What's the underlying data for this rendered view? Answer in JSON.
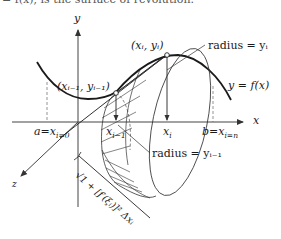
{
  "caption_fragment": "= f(x), is the surface of revolution.",
  "axes": {
    "x_label": "x",
    "y_label": "y",
    "z_label": "z"
  },
  "points": {
    "current": "(xᵢ, yᵢ)",
    "previous": "(xᵢ₋₁, yᵢ₋₁)"
  },
  "labels": {
    "radius_yi": "radius = yᵢ",
    "radius_yi_minus_1": "radius = yᵢ₋₁",
    "function": "y = f(x)",
    "a_bound": "a=x",
    "a_sub": "i=0",
    "b_bound": "b=x",
    "b_sub": "i=n",
    "xi": "x",
    "xi_sub": "i",
    "xi_minus_1": "x",
    "xi_minus_1_sub": "i−1",
    "slant_length": "√1 + [f′(ξᵢ)]²  Δxᵢ"
  },
  "colors": {
    "ink": "#1a1a1a",
    "axis": "#444444",
    "background": "#ffffff"
  }
}
